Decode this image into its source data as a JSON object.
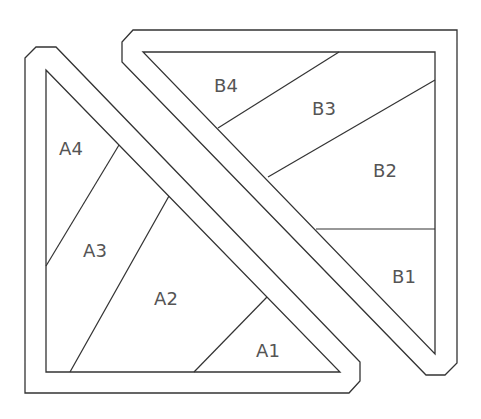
{
  "diagram": {
    "stroke_color": "#333333",
    "label_color": "#555555",
    "piece_a": {
      "outer": "25,58 36,47 56,47 360,362 360,381 349,393 25,393",
      "inner": "46,70 340,372 46,372",
      "dividers": [
        {
          "x1": 119,
          "y1": 145,
          "x2": 46,
          "y2": 266
        },
        {
          "x1": 169,
          "y1": 196,
          "x2": 70,
          "y2": 372
        },
        {
          "x1": 267,
          "y1": 297,
          "x2": 194,
          "y2": 372
        }
      ],
      "labels": [
        {
          "text": "A4",
          "x": 71,
          "y": 148
        },
        {
          "text": "A3",
          "x": 95,
          "y": 250
        },
        {
          "text": "A2",
          "x": 166,
          "y": 298
        },
        {
          "text": "A1",
          "x": 268,
          "y": 350
        }
      ]
    },
    "piece_b": {
      "outer": "133,30 457,30 457,363 445,375 426,375 122,62 122,42",
      "inner": "143,52 435,52 435,354",
      "dividers": [
        {
          "x1": 339,
          "y1": 52,
          "x2": 218,
          "y2": 128
        },
        {
          "x1": 435,
          "y1": 80,
          "x2": 268,
          "y2": 177
        },
        {
          "x1": 316,
          "y1": 229,
          "x2": 435,
          "y2": 229
        }
      ],
      "labels": [
        {
          "text": "B4",
          "x": 226,
          "y": 85
        },
        {
          "text": "B3",
          "x": 324,
          "y": 108
        },
        {
          "text": "B2",
          "x": 385,
          "y": 170
        },
        {
          "text": "B1",
          "x": 404,
          "y": 276
        }
      ]
    }
  }
}
